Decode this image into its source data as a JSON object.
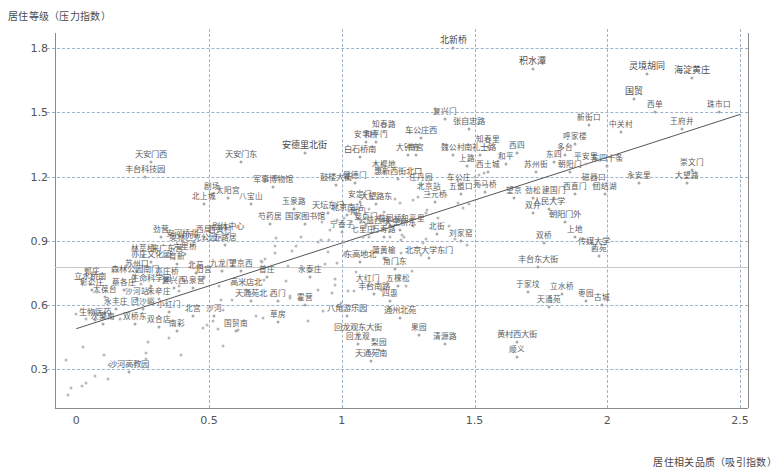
{
  "chart": {
    "type": "scatter",
    "title": "",
    "ylabel": "居住等级（压力指数）",
    "xlabel": "居住相关品质（吸引指数）",
    "xticks": [
      "0",
      "0.5",
      "1",
      "1.5",
      "2",
      "2.5"
    ],
    "yticks": [
      "1.8",
      "1.5",
      "1.2",
      "0.9",
      "0.6",
      "0.3"
    ],
    "xlim": [
      -0.08,
      2.53
    ],
    "ylim": [
      0.12,
      1.87
    ],
    "grid": "dashed-both",
    "reference_line_y": 0.78,
    "legend": "none"
  },
  "chart_data": {
    "type": "scatter",
    "title": "",
    "xlabel": "居住相关品质（吸引指数）",
    "ylabel": "居住等级（压力指数）",
    "xlim": [
      -0.08,
      2.53
    ],
    "ylim": [
      0.12,
      1.87
    ],
    "xticks": [
      0,
      0.5,
      1,
      1.5,
      2,
      2.5
    ],
    "yticks": [
      0.3,
      0.6,
      0.9,
      1.2,
      1.5,
      1.8
    ],
    "grid": true,
    "trendline": {
      "x0": 0.0,
      "y0": 0.49,
      "x1": 2.5,
      "y1": 1.49
    },
    "reference_line_y": 0.78,
    "points": [
      {
        "label": "北新桥",
        "x": 1.42,
        "y": 1.8
      },
      {
        "label": "积水潭",
        "x": 1.72,
        "y": 1.7
      },
      {
        "label": "灵境胡同",
        "x": 2.15,
        "y": 1.68
      },
      {
        "label": "海淀黄庄",
        "x": 2.32,
        "y": 1.66
      },
      {
        "label": "国贸",
        "x": 2.1,
        "y": 1.56
      },
      {
        "label": "西单",
        "x": 2.18,
        "y": 1.5
      },
      {
        "label": "珠市口",
        "x": 2.42,
        "y": 1.5
      },
      {
        "label": "复兴门",
        "x": 1.39,
        "y": 1.47
      },
      {
        "label": "新街口",
        "x": 1.93,
        "y": 1.44
      },
      {
        "label": "中关村",
        "x": 2.05,
        "y": 1.41
      },
      {
        "label": "王府井",
        "x": 2.28,
        "y": 1.42
      },
      {
        "label": "张自忠路",
        "x": 1.48,
        "y": 1.42
      },
      {
        "label": "知春路",
        "x": 1.16,
        "y": 1.41
      },
      {
        "label": "车公庄西",
        "x": 1.3,
        "y": 1.38
      },
      {
        "label": "安华桥",
        "x": 1.09,
        "y": 1.36
      },
      {
        "label": "和平门",
        "x": 1.13,
        "y": 1.36
      },
      {
        "label": "呼家楼",
        "x": 1.88,
        "y": 1.35
      },
      {
        "label": "知春里",
        "x": 1.55,
        "y": 1.34
      },
      {
        "label": "大钟寺",
        "x": 1.25,
        "y": 1.3
      },
      {
        "label": "白石桥南",
        "x": 1.07,
        "y": 1.29
      },
      {
        "label": "南宫",
        "x": 1.28,
        "y": 1.3
      },
      {
        "label": "魏公村",
        "x": 1.42,
        "y": 1.3
      },
      {
        "label": "南礼士路",
        "x": 1.52,
        "y": 1.3
      },
      {
        "label": "西四",
        "x": 1.66,
        "y": 1.31
      },
      {
        "label": "东四",
        "x": 1.8,
        "y": 1.27
      },
      {
        "label": "和平",
        "x": 1.62,
        "y": 1.26
      },
      {
        "label": "多台",
        "x": 1.84,
        "y": 1.3
      },
      {
        "label": "安德里北街",
        "x": 0.86,
        "y": 1.31
      },
      {
        "label": "天安门西",
        "x": 0.28,
        "y": 1.27
      },
      {
        "label": "天安门东",
        "x": 0.62,
        "y": 1.27
      },
      {
        "label": "东四十条",
        "x": 2.0,
        "y": 1.25
      },
      {
        "label": "崇文门",
        "x": 2.32,
        "y": 1.23
      },
      {
        "label": "木樨地",
        "x": 1.16,
        "y": 1.22
      },
      {
        "label": "西土城",
        "x": 1.55,
        "y": 1.22
      },
      {
        "label": "上路",
        "x": 1.47,
        "y": 1.25
      },
      {
        "label": "苏州街",
        "x": 1.73,
        "y": 1.22
      },
      {
        "label": "朝阳门",
        "x": 1.86,
        "y": 1.22
      },
      {
        "label": "惠新西街北口",
        "x": 1.21,
        "y": 1.19
      },
      {
        "label": "丰台科技园",
        "x": 0.26,
        "y": 1.2
      },
      {
        "label": "健德门",
        "x": 1.05,
        "y": 1.17
      },
      {
        "label": "永安里",
        "x": 2.12,
        "y": 1.17
      },
      {
        "label": "大望路",
        "x": 2.3,
        "y": 1.17
      },
      {
        "label": "鼓楼大街",
        "x": 0.98,
        "y": 1.16
      },
      {
        "label": "任丹园",
        "x": 1.3,
        "y": 1.16
      },
      {
        "label": "车公庄",
        "x": 1.44,
        "y": 1.16
      },
      {
        "label": "磁器口",
        "x": 1.95,
        "y": 1.16
      },
      {
        "label": "平安里",
        "x": 1.92,
        "y": 1.26
      },
      {
        "label": "军事博物馆",
        "x": 0.74,
        "y": 1.15
      },
      {
        "label": "团结湖",
        "x": 1.99,
        "y": 1.12
      },
      {
        "label": "剧场",
        "x": 0.51,
        "y": 1.12
      },
      {
        "label": "太阳宫",
        "x": 0.57,
        "y": 1.1
      },
      {
        "label": "北上城",
        "x": 0.48,
        "y": 1.07
      },
      {
        "label": "八宝山",
        "x": 0.66,
        "y": 1.07
      },
      {
        "label": "北京站",
        "x": 1.33,
        "y": 1.12
      },
      {
        "label": "五道口",
        "x": 1.45,
        "y": 1.12
      },
      {
        "label": "亮马桥",
        "x": 1.54,
        "y": 1.13
      },
      {
        "label": "西直门",
        "x": 1.88,
        "y": 1.12
      },
      {
        "label": "建国门",
        "x": 1.8,
        "y": 1.1
      },
      {
        "label": "望京",
        "x": 1.65,
        "y": 1.1
      },
      {
        "label": "劲松",
        "x": 1.72,
        "y": 1.1
      },
      {
        "label": "三元桥",
        "x": 1.35,
        "y": 1.08
      },
      {
        "label": "玉泉路",
        "x": 0.82,
        "y": 1.05
      },
      {
        "label": "安定门",
        "x": 1.07,
        "y": 1.08
      },
      {
        "label": "大望路东",
        "x": 1.13,
        "y": 1.07
      },
      {
        "label": "双井",
        "x": 1.72,
        "y": 1.03
      },
      {
        "label": "人民大学",
        "x": 1.78,
        "y": 1.05
      },
      {
        "label": "天坛东门",
        "x": 0.95,
        "y": 1.03
      },
      {
        "label": "角门",
        "x": 1.06,
        "y": 1.0
      },
      {
        "label": "北京南站",
        "x": 1.02,
        "y": 1.02
      },
      {
        "label": "朝阳门外",
        "x": 1.84,
        "y": 0.99
      },
      {
        "label": "国家图书馆",
        "x": 0.86,
        "y": 0.98
      },
      {
        "label": "芍药居",
        "x": 0.73,
        "y": 0.98
      },
      {
        "label": "公益西桥",
        "x": 1.12,
        "y": 0.96
      },
      {
        "label": "花园桥",
        "x": 1.18,
        "y": 0.97
      },
      {
        "label": "和平里",
        "x": 1.27,
        "y": 0.97
      },
      {
        "label": "安贞门",
        "x": 1.09,
        "y": 0.98
      },
      {
        "label": "宁香子",
        "x": 1.0,
        "y": 0.94
      },
      {
        "label": "七里庄",
        "x": 1.08,
        "y": 0.92
      },
      {
        "label": "万寿路",
        "x": 1.16,
        "y": 0.92
      },
      {
        "label": "大望桥东",
        "x": 1.22,
        "y": 0.95
      },
      {
        "label": "北街",
        "x": 1.36,
        "y": 0.93
      },
      {
        "label": "刘家窑",
        "x": 1.45,
        "y": 0.9
      },
      {
        "label": "剧体中心",
        "x": 0.57,
        "y": 0.93
      },
      {
        "label": "西局",
        "x": 0.48,
        "y": 0.92
      },
      {
        "label": "西黄村",
        "x": 0.54,
        "y": 0.92
      },
      {
        "label": "劲营",
        "x": 0.32,
        "y": 0.92
      },
      {
        "label": "安河桥北",
        "x": 0.4,
        "y": 0.9
      },
      {
        "label": "奥林匹克公园",
        "x": 0.44,
        "y": 0.88
      },
      {
        "label": "上地",
        "x": 1.88,
        "y": 0.92
      },
      {
        "label": "五路居",
        "x": 0.56,
        "y": 0.88
      },
      {
        "label": "双桥",
        "x": 1.76,
        "y": 0.89
      },
      {
        "label": "传媒大学",
        "x": 1.95,
        "y": 0.86
      },
      {
        "label": "六里桥",
        "x": 0.41,
        "y": 0.84
      },
      {
        "label": "林萃桥",
        "x": 0.25,
        "y": 0.83
      },
      {
        "label": "来广东营",
        "x": 0.34,
        "y": 0.83
      },
      {
        "label": "西苑",
        "x": 1.97,
        "y": 0.83
      },
      {
        "label": "蒲黄榆",
        "x": 1.16,
        "y": 0.82
      },
      {
        "label": "北京大学东门",
        "x": 1.33,
        "y": 0.82
      },
      {
        "label": "亦庄文化园",
        "x": 0.28,
        "y": 0.8
      },
      {
        "label": "育新",
        "x": 0.38,
        "y": 0.79
      },
      {
        "label": "东高地北",
        "x": 1.07,
        "y": 0.8
      },
      {
        "label": "角门东",
        "x": 1.2,
        "y": 0.77
      },
      {
        "label": "丰台东大街",
        "x": 1.74,
        "y": 0.78
      },
      {
        "label": "苏州口",
        "x": 0.23,
        "y": 0.76
      },
      {
        "label": "北苑",
        "x": 0.45,
        "y": 0.75
      },
      {
        "label": "九龙门",
        "x": 0.55,
        "y": 0.76
      },
      {
        "label": "望京西",
        "x": 0.62,
        "y": 0.76
      },
      {
        "label": "旧宫",
        "x": 0.48,
        "y": 0.73
      },
      {
        "label": "永泰庄",
        "x": 0.88,
        "y": 0.73
      },
      {
        "label": "郭庄",
        "x": 0.06,
        "y": 0.72
      },
      {
        "label": "森林公园南门",
        "x": 0.22,
        "y": 0.73
      },
      {
        "label": "亦庄桥",
        "x": 0.34,
        "y": 0.72
      },
      {
        "label": "普庄",
        "x": 0.72,
        "y": 0.73
      },
      {
        "label": "立水桥南",
        "x": 0.05,
        "y": 0.7
      },
      {
        "label": "生命科学园",
        "x": 0.28,
        "y": 0.69
      },
      {
        "label": "彰公庄",
        "x": 0.06,
        "y": 0.67
      },
      {
        "label": "蔡各庄",
        "x": 0.18,
        "y": 0.67
      },
      {
        "label": "复兴西",
        "x": 0.37,
        "y": 0.68
      },
      {
        "label": "马泉营",
        "x": 0.44,
        "y": 0.68
      },
      {
        "label": "高米店北",
        "x": 0.64,
        "y": 0.67
      },
      {
        "label": "大红门",
        "x": 1.1,
        "y": 0.69
      },
      {
        "label": "五棵松",
        "x": 1.21,
        "y": 0.69
      },
      {
        "label": "丰台南路",
        "x": 1.12,
        "y": 0.65
      },
      {
        "label": "于家坟",
        "x": 1.7,
        "y": 0.66
      },
      {
        "label": "立水桥",
        "x": 1.83,
        "y": 0.65
      },
      {
        "label": "四惠",
        "x": 1.18,
        "y": 0.62
      },
      {
        "label": "大葆台",
        "x": 0.11,
        "y": 0.64
      },
      {
        "label": "沙河站",
        "x": 0.23,
        "y": 0.63
      },
      {
        "label": "朱辛庄",
        "x": 0.31,
        "y": 0.63
      },
      {
        "label": "天通苑北",
        "x": 0.66,
        "y": 0.62
      },
      {
        "label": "西门",
        "x": 0.76,
        "y": 0.62
      },
      {
        "label": "霍营",
        "x": 0.86,
        "y": 0.6
      },
      {
        "label": "枣园",
        "x": 1.92,
        "y": 0.62
      },
      {
        "label": "古城",
        "x": 1.98,
        "y": 0.6
      },
      {
        "label": "天通苑",
        "x": 1.78,
        "y": 0.59
      },
      {
        "label": "永丰庄",
        "x": 0.15,
        "y": 0.58
      },
      {
        "label": "回沙峪",
        "x": 0.25,
        "y": 0.58
      },
      {
        "label": "小红门",
        "x": 0.35,
        "y": 0.57
      },
      {
        "label": "北宫",
        "x": 0.44,
        "y": 0.55
      },
      {
        "label": "沙河",
        "x": 0.52,
        "y": 0.55
      },
      {
        "label": "八角游乐园",
        "x": 1.02,
        "y": 0.55
      },
      {
        "label": "通州北苑",
        "x": 1.22,
        "y": 0.54
      },
      {
        "label": "生物医药",
        "x": 0.07,
        "y": 0.53
      },
      {
        "label": "草房",
        "x": 0.76,
        "y": 0.52
      },
      {
        "label": "次渠南",
        "x": 0.1,
        "y": 0.51
      },
      {
        "label": "双桥东",
        "x": 0.22,
        "y": 0.51
      },
      {
        "label": "双合店",
        "x": 0.31,
        "y": 0.5
      },
      {
        "label": "南彩",
        "x": 0.38,
        "y": 0.48
      },
      {
        "label": "国贸南",
        "x": 0.6,
        "y": 0.48
      },
      {
        "label": "回龙观东大街",
        "x": 1.06,
        "y": 0.46
      },
      {
        "label": "果园",
        "x": 1.29,
        "y": 0.46
      },
      {
        "label": "回龙观",
        "x": 1.06,
        "y": 0.42
      },
      {
        "label": "清源路",
        "x": 1.39,
        "y": 0.42
      },
      {
        "label": "梨园",
        "x": 1.14,
        "y": 0.39
      },
      {
        "label": "黄村西大街",
        "x": 1.66,
        "y": 0.43
      },
      {
        "label": "顺义",
        "x": 1.66,
        "y": 0.36
      },
      {
        "label": "天通苑南",
        "x": 1.11,
        "y": 0.34
      },
      {
        "label": "沙河高教园",
        "x": 0.2,
        "y": 0.29
      }
    ],
    "extra_unlabeled_count": 120
  },
  "colors": {
    "point": "#a8a8a8",
    "grid": "#9fb3c8",
    "axis": "#8a8a8a",
    "text": "#5c5c5c",
    "trendline": "#555555",
    "background": "#ffffff"
  }
}
